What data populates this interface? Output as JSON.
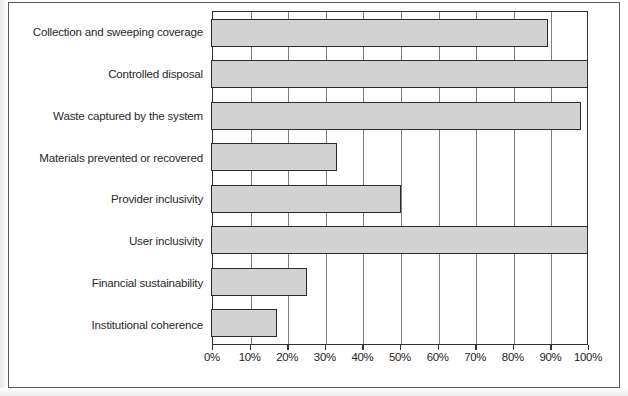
{
  "chart_data": {
    "type": "bar",
    "orientation": "horizontal",
    "title": "",
    "subtitle": "",
    "xlabel": "",
    "ylabel": "",
    "xlim": [
      0,
      100
    ],
    "grid": true,
    "legend": null,
    "legend_position": "none",
    "unit": "%",
    "categories": [
      "Collection and sweeping coverage",
      "Controlled disposal",
      "Waste captured by the system",
      "Materials prevented or recovered",
      "Provider inclusivity",
      "User inclusivity",
      "Financial sustainability",
      "Institutional coherence"
    ],
    "values": [
      89,
      100,
      98,
      33,
      50,
      100,
      25,
      17
    ],
    "value_labels": [
      "89%",
      "100%",
      "98%",
      "33%",
      "50%",
      "100%",
      "25%",
      "17%"
    ],
    "xticks": [
      0,
      10,
      20,
      30,
      40,
      50,
      60,
      70,
      80,
      90,
      100
    ],
    "xtick_labels": [
      "0%",
      "10%",
      "20%",
      "30%",
      "40%",
      "50%",
      "60%",
      "70%",
      "80%",
      "90%",
      "100%"
    ]
  },
  "style": {
    "bar_fill": "#d2d2d2",
    "bar_border": "#2b2b2b",
    "grid_color": "#808080",
    "axis_color": "#333333",
    "frame_color": "#5a5a5a",
    "background": "#ffffff",
    "text_color": "#2a2a2a"
  }
}
